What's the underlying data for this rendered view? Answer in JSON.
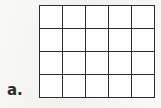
{
  "page": {
    "background_color": "#f3f2f0",
    "width": 161,
    "height": 108
  },
  "item": {
    "label": "a.",
    "label_color": "#2b2b2b"
  },
  "figure": {
    "name": "blank-rectangular-grid",
    "type": "grid",
    "columns": 5,
    "rows": 4,
    "total_cells": 20,
    "cell_fill_color": "#fefefe",
    "line_color": "#2c2c2c",
    "cell_values": [
      [
        "",
        "",
        "",
        "",
        ""
      ],
      [
        "",
        "",
        "",
        "",
        ""
      ],
      [
        "",
        "",
        "",
        "",
        ""
      ],
      [
        "",
        "",
        "",
        "",
        ""
      ]
    ]
  }
}
